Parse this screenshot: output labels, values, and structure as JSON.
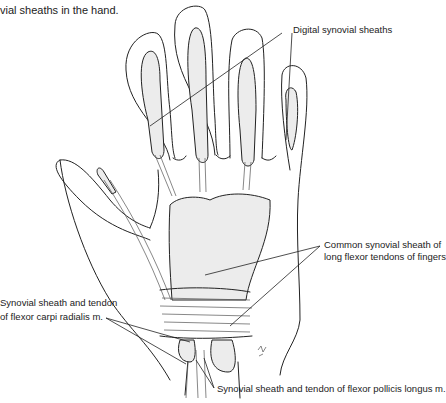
{
  "caption": "vial sheaths in the hand.",
  "labels": {
    "digital": "Digital synovial sheaths",
    "common_line1": "Common synovial sheath of",
    "common_line2": "long flexor tendons of fingers",
    "fcr_line1": "Synovial sheath and tendon",
    "fcr_line2": "of flexor carpi radialis m.",
    "fpl": "Synovial sheath and tendon of flexor pollicis longus m."
  },
  "colors": {
    "sheath_fill": "#ececec",
    "line": "#222222",
    "background": "#ffffff"
  }
}
